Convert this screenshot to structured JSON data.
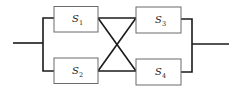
{
  "diagram": {
    "type": "reliability-block-diagram",
    "components": [
      {
        "id": "S1",
        "base": "S",
        "sub": "1",
        "position": "top-left"
      },
      {
        "id": "S2",
        "base": "S",
        "sub": "2",
        "position": "bottom-left"
      },
      {
        "id": "S3",
        "base": "S",
        "sub": "3",
        "position": "top-right"
      },
      {
        "id": "S4",
        "base": "S",
        "sub": "4",
        "position": "bottom-right"
      }
    ],
    "connections": [
      [
        "input",
        "S1"
      ],
      [
        "input",
        "S2"
      ],
      [
        "S1",
        "S3"
      ],
      [
        "S1",
        "S4"
      ],
      [
        "S2",
        "S3"
      ],
      [
        "S2",
        "S4"
      ],
      [
        "S3",
        "output"
      ],
      [
        "S4",
        "output"
      ]
    ]
  }
}
